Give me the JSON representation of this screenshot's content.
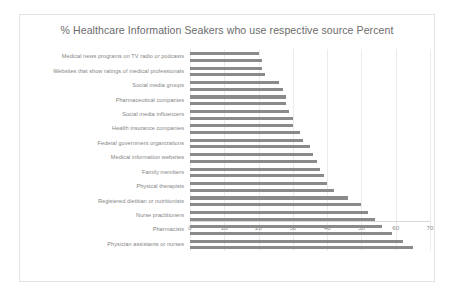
{
  "chart_data": {
    "type": "bar",
    "orientation": "horizontal",
    "title": "% Healthcare Information Seakers who use respective source Percent",
    "xlabel": "",
    "ylabel": "",
    "xlim": [
      0,
      70
    ],
    "xticks": [
      0,
      10,
      20,
      30,
      40,
      50,
      60,
      70
    ],
    "grid": true,
    "legend": "none",
    "bar_color": "#8a8a8a",
    "bars_per_category": 2,
    "categories": [
      "Medical news programs on TV radio or podcasts",
      "Websites that show ratings of medical professionals",
      "Social media groups",
      "Pharmaceutical companies",
      "Social media influencers",
      "Health insurance companies",
      "Federal government organizations",
      "Medical information websites",
      "Family members",
      "Physical therapists",
      "Registered dietitian or nutritionists",
      "Nurse practitioners",
      "Pharmacists",
      "Physician assistants or nurses"
    ],
    "series": [
      {
        "name": "Percent",
        "values": [
          20,
          21,
          26,
          28,
          29,
          30,
          33,
          36,
          38,
          40,
          46,
          52,
          56,
          62
        ]
      },
      {
        "name": "Percent",
        "values": [
          21,
          22,
          27,
          28,
          30,
          32,
          35,
          37,
          39,
          42,
          50,
          54,
          59,
          65
        ]
      }
    ]
  }
}
